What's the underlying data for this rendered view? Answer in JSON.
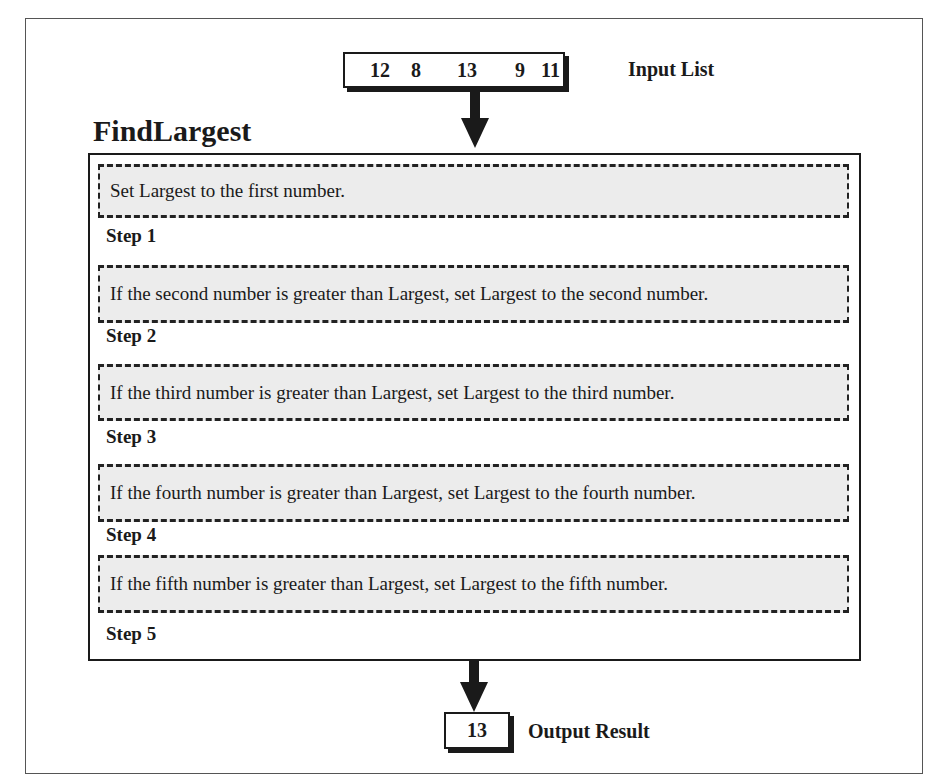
{
  "input": {
    "values": [
      "12",
      "8",
      "13",
      "9",
      "11"
    ],
    "label": "Input List"
  },
  "algorithm": {
    "title": "FindLargest",
    "steps": [
      {
        "label": "Step 1",
        "text": "Set Largest to the first number."
      },
      {
        "label": "Step 2",
        "text": "If the second number is greater than Largest, set Largest to the second number."
      },
      {
        "label": "Step 3",
        "text": "If the third number is greater than Largest, set Largest to the third number."
      },
      {
        "label": "Step 4",
        "text": "If the fourth number is greater than Largest, set Largest to the fourth number."
      },
      {
        "label": "Step 5",
        "text": "If the fifth number is greater than Largest, set Largest to the fifth number."
      }
    ]
  },
  "output": {
    "value": "13",
    "label": "Output Result"
  },
  "colors": {
    "step_fill": "#ececec",
    "stroke": "#1a1a1a"
  }
}
